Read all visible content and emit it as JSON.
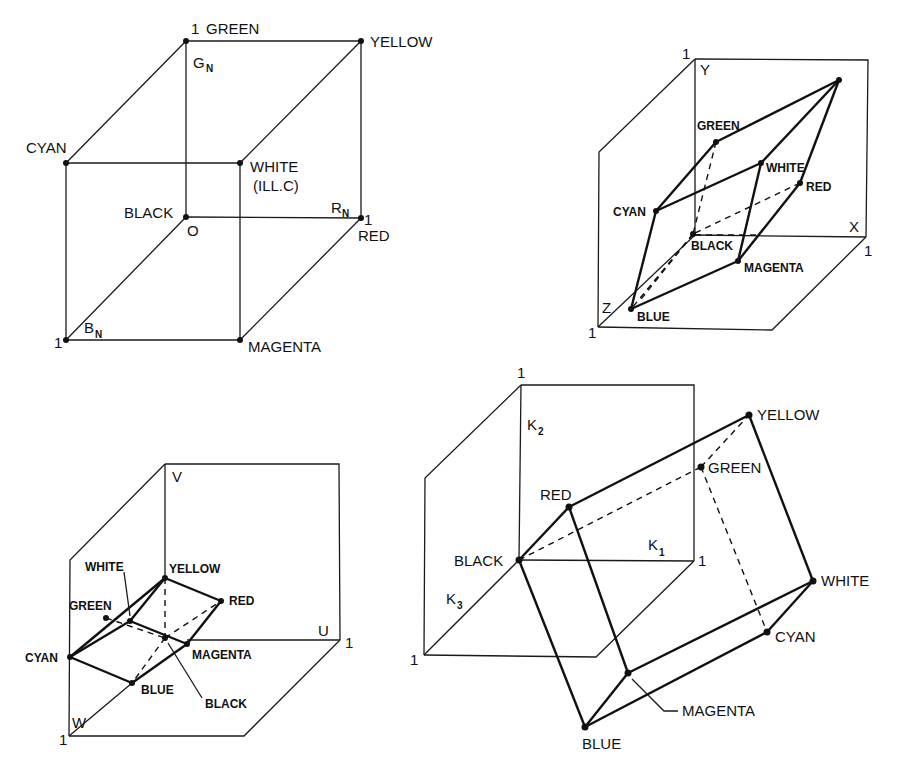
{
  "figure": {
    "panels": [
      {
        "id": "rgb-cube",
        "axes": {
          "g": "G",
          "g_sub": "N",
          "r": "R",
          "r_sub": "N",
          "b": "B",
          "b_sub": "N",
          "origin": "O",
          "unit_g": "1",
          "unit_r": "1",
          "unit_b": "1"
        },
        "vertices": {
          "green": "GREEN",
          "yellow": "YELLOW",
          "cyan": "CYAN",
          "white": "WHITE",
          "white_note": "(ILL.C)",
          "black": "BLACK",
          "red": "RED",
          "magenta": "MAGENTA"
        }
      },
      {
        "id": "xyz-space",
        "axes": {
          "x": "X",
          "y": "Y",
          "z": "Z",
          "unit_x": "1",
          "unit_y": "1",
          "unit_z": "1"
        },
        "vertices": {
          "green": "GREEN",
          "white": "WHITE",
          "red": "RED",
          "cyan": "CYAN",
          "black": "BLACK",
          "magenta": "MAGENTA",
          "blue": "BLUE"
        }
      },
      {
        "id": "uvw-space",
        "axes": {
          "u": "U",
          "v": "V",
          "w": "W",
          "unit_u": "1",
          "unit_w": "1"
        },
        "vertices": {
          "white": "WHITE",
          "yellow": "YELLOW",
          "green": "GREEN",
          "red": "RED",
          "cyan": "CYAN",
          "magenta": "MAGENTA",
          "blue": "BLUE",
          "black": "BLACK"
        }
      },
      {
        "id": "k-space",
        "axes": {
          "k1": "K",
          "k1_sub": "1",
          "k2": "K",
          "k2_sub": "2",
          "k3": "K",
          "k3_sub": "3",
          "unit_k1": "1",
          "unit_k2": "1",
          "unit_k3": "1"
        },
        "vertices": {
          "yellow": "YELLOW",
          "green": "GREEN",
          "red": "RED",
          "black": "BLACK",
          "white": "WHITE",
          "cyan": "CYAN",
          "magenta": "MAGENTA",
          "blue": "BLUE"
        }
      }
    ]
  }
}
